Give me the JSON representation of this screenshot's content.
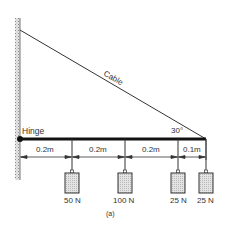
{
  "figure": {
    "caption": "(a)",
    "cable_label": "Cable",
    "hinge_label": "Hinge",
    "angle_label": "30°",
    "dimensions": [
      "0.2m",
      "0.2m",
      "0.2m",
      "0.1m"
    ],
    "weights": [
      "50 N",
      "100 N",
      "25 N",
      "25 N"
    ],
    "colors": {
      "line": "#2a2a2a",
      "beam": "#111111",
      "weight_fill": "#d4d4d4",
      "wall_hatch": "#9a9a9a"
    }
  }
}
